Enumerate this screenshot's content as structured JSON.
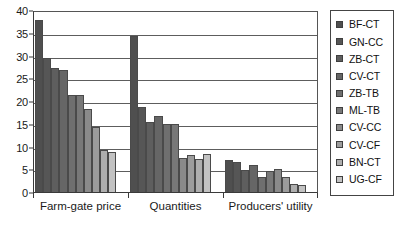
{
  "chart_data": {
    "type": "bar",
    "title": "",
    "subtitle": "",
    "xlabel": "",
    "ylabel": "",
    "ylim": [
      0,
      40
    ],
    "ytick_step": 5,
    "yticks": [
      40,
      35,
      30,
      25,
      20,
      15,
      10,
      5,
      0
    ],
    "grid": true,
    "legend_position": "right",
    "categories": [
      "Farm-gate price",
      "Quantities",
      "Producers' utility"
    ],
    "series": [
      {
        "name": "BF-CT",
        "color": "#4f4f4f",
        "values": [
          37.7,
          34.2,
          7.0
        ]
      },
      {
        "name": "GN-CC",
        "color": "#565656",
        "values": [
          29.4,
          18.7,
          6.5
        ]
      },
      {
        "name": "ZB-CT",
        "color": "#5e5e5e",
        "values": [
          27.2,
          15.4,
          4.9
        ]
      },
      {
        "name": "CV-CT",
        "color": "#666666",
        "values": [
          26.8,
          16.6,
          6.0
        ]
      },
      {
        "name": "ZB-TB",
        "color": "#6f6f6f",
        "values": [
          21.3,
          15.0,
          3.2
        ]
      },
      {
        "name": "ML-TB",
        "color": "#787878",
        "values": [
          21.3,
          14.9,
          4.7
        ]
      },
      {
        "name": "CV-CC",
        "color": "#8a8a8a",
        "values": [
          18.2,
          7.4,
          5.1
        ]
      },
      {
        "name": "CV-CF",
        "color": "#9c9c9c",
        "values": [
          14.3,
          8.1,
          3.4
        ]
      },
      {
        "name": "BN-CT",
        "color": "#aeaeae",
        "values": [
          9.3,
          7.2,
          1.8
        ]
      },
      {
        "name": "UG-CF",
        "color": "#c2c2c2",
        "values": [
          8.7,
          8.3,
          1.6
        ]
      }
    ]
  },
  "legend": {
    "items": [
      {
        "label": "BF-CT"
      },
      {
        "label": "GN-CC"
      },
      {
        "label": "ZB-CT"
      },
      {
        "label": "CV-CT"
      },
      {
        "label": "ZB-TB"
      },
      {
        "label": "ML-TB"
      },
      {
        "label": "CV-CC"
      },
      {
        "label": "CV-CF"
      },
      {
        "label": "BN-CT"
      },
      {
        "label": "UG-CF"
      }
    ]
  }
}
